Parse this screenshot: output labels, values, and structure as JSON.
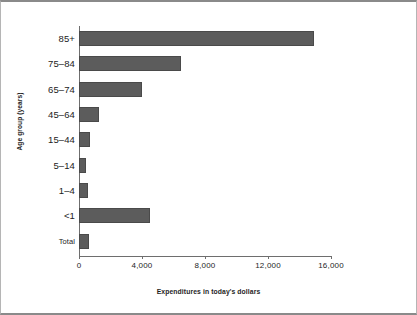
{
  "chart_data": {
    "type": "bar",
    "orientation": "horizontal",
    "title": "",
    "xlabel": "Expenditures in today's dollars",
    "ylabel": "Age group (years)",
    "categories": [
      "85+",
      "75–84",
      "65–74",
      "45–64",
      "15–44",
      "5–14",
      "1–4",
      "<1",
      "Total"
    ],
    "values": [
      14900,
      6450,
      4000,
      1270,
      680,
      420,
      600,
      4500,
      620
    ],
    "xlim": [
      0,
      17000
    ],
    "xticks": [
      0,
      4000,
      8000,
      12000,
      16000
    ],
    "xticklabels": [
      "0",
      "4,000",
      "8,000",
      "12,000",
      "16,000"
    ],
    "grid": false,
    "legend": false,
    "bar_color": "#5c5c5c",
    "bar_edge_color": "#4a4a4a",
    "background_color": "#ffffff",
    "axis_color": "#6e6e6e",
    "frame_color": "#8a8a8a"
  }
}
